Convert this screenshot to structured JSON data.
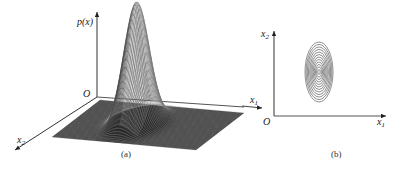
{
  "figure": {
    "panel_a": {
      "caption": "(a)",
      "vertical_axis_label": "p(x)",
      "origin_label": "O",
      "axis1_label": "x",
      "axis1_sub": "1",
      "axis2_label": "x",
      "axis2_sub": "2",
      "description": "3D surface plot of bivariate Gaussian density"
    },
    "panel_b": {
      "caption": "(b)",
      "origin_label": "O",
      "x_axis_label": "x",
      "x_axis_sub": "1",
      "y_axis_label": "x",
      "y_axis_sub": "2",
      "description": "Contour plot of bivariate Gaussian density",
      "contour_count": 12
    }
  },
  "chart_data": [
    {
      "type": "surface",
      "title": "(a)",
      "zlabel": "p(x)",
      "xlabel": "x1",
      "ylabel": "x2",
      "distribution": "bivariate normal",
      "shape": "single peak, elongated along x2"
    },
    {
      "type": "contour",
      "title": "(b)",
      "xlabel": "x1",
      "ylabel": "x2",
      "levels": 12,
      "shape": "concentric ellipses, major axis along x2"
    }
  ]
}
